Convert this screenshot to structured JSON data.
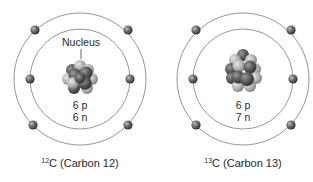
{
  "atoms": [
    {
      "id": "carbon-12",
      "mass_number": "12",
      "symbol": "C",
      "name": " (Carbon 12)",
      "protons_label": "6 p",
      "neutrons_label": "6 n",
      "nucleus_label": "Nucleus",
      "electrons": 6
    },
    {
      "id": "carbon-13",
      "mass_number": "13",
      "symbol": "C",
      "name": " (Carbon 13)",
      "protons_label": "6 p",
      "neutrons_label": "7 n",
      "nucleus_label": "",
      "electrons": 6
    }
  ],
  "colors": {
    "orbit": "#8a8a8a",
    "electron": "#5a5a5a",
    "proton": "#666666",
    "neutron": "#b5b5b5",
    "text": "#2a2a2a"
  }
}
